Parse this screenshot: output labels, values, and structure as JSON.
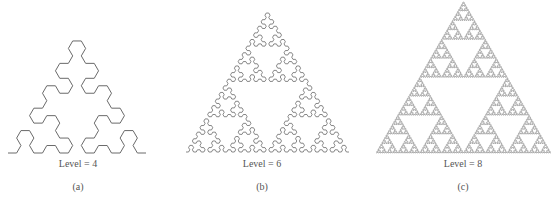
{
  "figure": {
    "panels": [
      {
        "id": "a",
        "caption": "(a)",
        "level_text": "Level = 4",
        "level": 4,
        "curve": "sierpinski-arrowhead",
        "bounds": {
          "x0": 8,
          "x1": 146,
          "y_base": 153
        },
        "stroke": "#6a6a6a",
        "stroke_width": 1.0,
        "label_x": 78,
        "level_label_y": 158,
        "caption_y": 181
      },
      {
        "id": "b",
        "caption": "(b)",
        "level_text": "Level = 6",
        "level": 6,
        "curve": "sierpinski-arrowhead",
        "bounds": {
          "x0": 186,
          "x1": 349,
          "y_base": 152
        },
        "stroke": "#6a6a6a",
        "stroke_width": 0.8,
        "label_x": 262,
        "level_label_y": 158,
        "caption_y": 181
      },
      {
        "id": "c",
        "caption": "(c)",
        "level_text": "Level = 8",
        "level": 8,
        "curve": "sierpinski-arrowhead",
        "bounds": {
          "x0": 376,
          "x1": 551,
          "y_base": 153
        },
        "stroke": "#777777",
        "stroke_width": 0.6,
        "label_x": 463,
        "level_label_y": 158,
        "caption_y": 181
      }
    ]
  }
}
